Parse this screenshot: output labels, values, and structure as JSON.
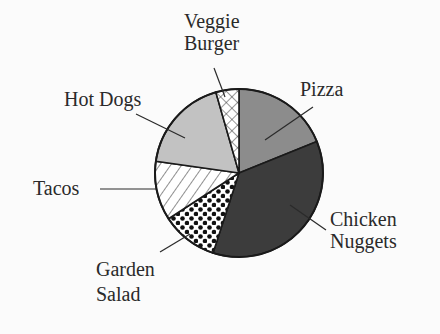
{
  "chart_data": {
    "type": "pie",
    "title": "",
    "legend": "none (slices labeled with leader lines)",
    "start_angle": "12 o'clock, clockwise",
    "categories": [
      "Pizza",
      "Chicken Nuggets",
      "Garden Salad",
      "Tacos",
      "Hot Dogs",
      "Veggie Burger"
    ],
    "values": [
      19,
      36,
      11,
      11,
      18,
      5
    ],
    "unit": "percent (estimated from slice angles)",
    "slices": [
      {
        "name": "Pizza",
        "value": 19,
        "start_deg": 0,
        "end_deg": 68,
        "fill": "medium-gray",
        "color": "#8c8c8c"
      },
      {
        "name": "Chicken Nuggets",
        "value": 36,
        "start_deg": 68,
        "end_deg": 198,
        "fill": "dark-gray",
        "color": "#3c3c3c"
      },
      {
        "name": "Garden Salad",
        "value": 11,
        "start_deg": 198,
        "end_deg": 237,
        "fill": "black-dots",
        "color": "#ffffff"
      },
      {
        "name": "Tacos",
        "value": 11,
        "start_deg": 237,
        "end_deg": 278,
        "fill": "diagonal-hatch",
        "color": "#ffffff"
      },
      {
        "name": "Hot Dogs",
        "value": 18,
        "start_deg": 278,
        "end_deg": 344,
        "fill": "light-gray",
        "color": "#c2c2c2"
      },
      {
        "name": "Veggie Burger",
        "value": 5,
        "start_deg": 344,
        "end_deg": 360,
        "fill": "cross-hatch",
        "color": "#ffffff"
      }
    ]
  },
  "labels": {
    "pizza": "Pizza",
    "chicken_line1": "Chicken",
    "chicken_line2": "Nuggets",
    "salad_line1": "Garden",
    "salad_line2": "Salad",
    "tacos": "Tacos",
    "hotdogs": "Hot Dogs",
    "veggie_line1": "Veggie",
    "veggie_line2": "Burger"
  }
}
